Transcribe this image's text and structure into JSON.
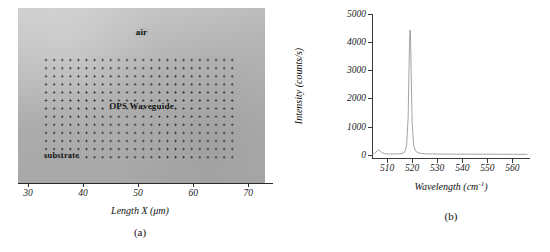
{
  "figure": {
    "panel_a": {
      "caption": "(a)",
      "axis_title": "Length X (μm)",
      "xticks": [
        "30",
        "40",
        "50",
        "60",
        "70"
      ],
      "xtick_values": [
        30,
        40,
        50,
        60,
        70
      ],
      "annotations": {
        "air": "air",
        "waveguide": "OPS Waveguide",
        "substrate": "substrate"
      },
      "image_description": "grayscale micrograph with dot-grid of Raman mapping points"
    },
    "panel_b": {
      "caption": "(b)"
    }
  },
  "chart_data": {
    "type": "line",
    "title": "",
    "xlabel": "Wavelength (cm⁻¹)",
    "ylabel": "Intensity (counts/s)",
    "xlim": [
      504,
      567
    ],
    "ylim": [
      -150,
      5000
    ],
    "xticks": [
      510,
      520,
      530,
      540,
      550,
      560
    ],
    "xticklabels": [
      "510",
      "520",
      "530",
      "540",
      "550",
      "560"
    ],
    "yticks": [
      0,
      1000,
      2000,
      3000,
      4000,
      5000
    ],
    "yticklabels": [
      "0",
      "1000",
      "2000",
      "3000",
      "4000",
      "5000"
    ],
    "grid": false,
    "legend": null,
    "series": [
      {
        "name": "Raman spectrum",
        "color": "#8c8c8c",
        "peak_center": 519.2,
        "peak_height": 4430,
        "peak_fwhm": 1.1,
        "x": [
          504,
          505,
          506,
          506.6,
          507.2,
          508,
          509,
          510,
          511,
          512,
          513,
          514,
          515,
          516,
          517,
          517.8,
          518.4,
          518.8,
          519.0,
          519.2,
          519.4,
          519.6,
          520.0,
          520.6,
          521.4,
          522.4,
          523.5,
          525,
          527,
          530,
          533,
          536,
          539,
          542,
          545,
          548,
          551,
          554,
          557,
          560,
          563,
          566
        ],
        "y": [
          30,
          60,
          130,
          175,
          140,
          75,
          40,
          30,
          28,
          26,
          28,
          30,
          35,
          45,
          90,
          320,
          1300,
          3200,
          4100,
          4430,
          4050,
          3000,
          1150,
          330,
          130,
          70,
          48,
          36,
          30,
          26,
          24,
          24,
          22,
          22,
          20,
          20,
          20,
          18,
          18,
          18,
          16,
          16
        ]
      }
    ]
  }
}
